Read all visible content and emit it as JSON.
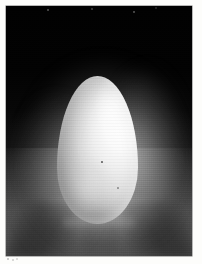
{
  "page": {
    "background_color": "#fdfdfb",
    "width": 202,
    "height": 264,
    "caption": ""
  },
  "photo": {
    "subject": "egg",
    "description": "A single white chicken egg standing upright on a lit surface against a black background",
    "orientation": "portrait",
    "frame": {
      "left": 6,
      "top": 6,
      "width": 186,
      "height": 250,
      "border_color": "#050505"
    },
    "medium": "black-and-white photograph",
    "colors": {
      "background_dark": "#010101",
      "backdrop_lower": "#414141",
      "egg_highlight": "#ffffff",
      "egg_midtone": "#dedede",
      "egg_shadow": "#6e6e6e",
      "ground_light": "#bdbdbd",
      "glow": "#ebebeb"
    },
    "lighting": {
      "key_light_direction": "upper-right",
      "rim_light": "right edge of egg",
      "shadow_rays": "radiating down-left and down-right from base"
    },
    "subject_geometry": {
      "left": 51,
      "top": 70,
      "width": 81,
      "height": 148,
      "shape": "ovoid, narrow at top, broad at base"
    }
  }
}
